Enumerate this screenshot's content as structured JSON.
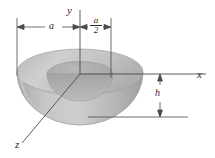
{
  "figure": {
    "background_color": "#ffffff",
    "line_color": "#4a4a4a",
    "text_color": "#2b2b2b"
  },
  "axes": [
    {
      "name": "y-axis",
      "label": "y",
      "direction": "up"
    },
    {
      "name": "x-axis",
      "label": "x",
      "direction": "right"
    },
    {
      "name": "z-axis",
      "label": "z",
      "direction": "lower-left"
    }
  ],
  "labels": {
    "y_axis": "y",
    "x_axis": "x",
    "z_axis": "z",
    "outer_radius": "a",
    "inner_radius_numerator": "a",
    "inner_radius_denominator": "2",
    "depth": "h"
  },
  "dimensions": [
    {
      "name": "outer-radius-dimension",
      "label": "a",
      "kind": "horizontal"
    },
    {
      "name": "inner-radius-dimension",
      "label": "a/2",
      "kind": "horizontal"
    },
    {
      "name": "depth-dimension",
      "label": "h",
      "kind": "vertical"
    }
  ],
  "solid": {
    "name": "hemispherical-bowl",
    "outer_rim_color": "#c4c4c4",
    "inner_surface_color": "#b0b0b0",
    "body_color": "#b8b8b8",
    "cavity_color": "#a8a8a8",
    "highlight_color": "#d2d2d2"
  }
}
